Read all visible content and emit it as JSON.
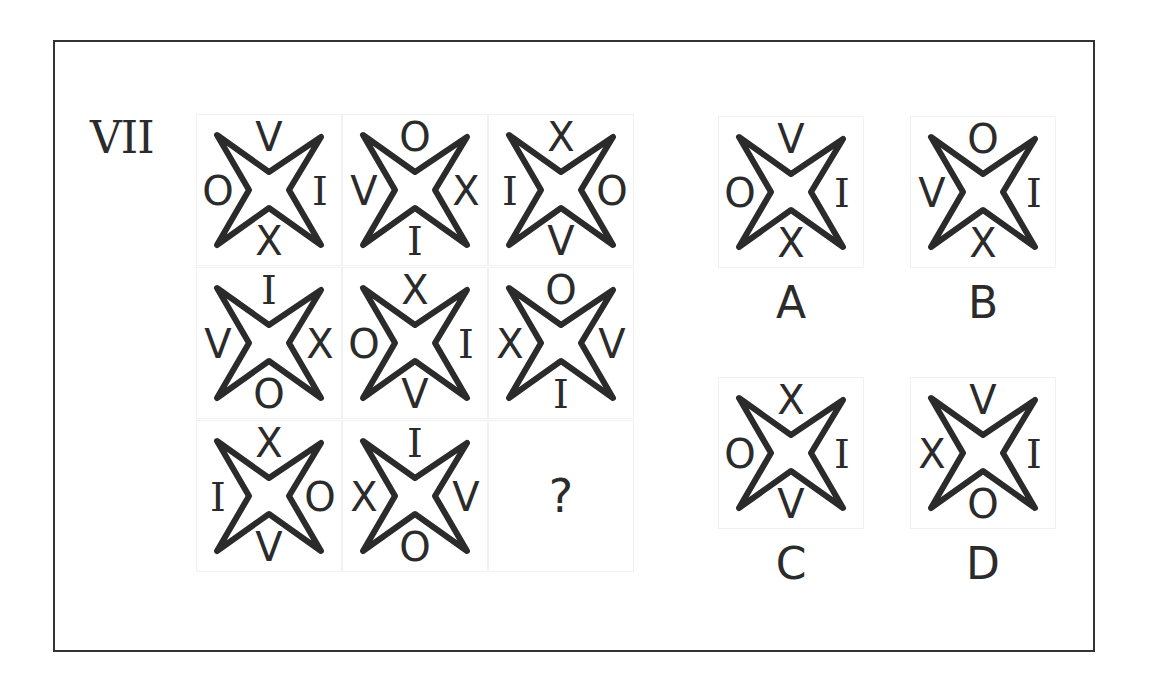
{
  "puzzle": {
    "number": "VII",
    "matrix": [
      {
        "top": "V",
        "left": "O",
        "right": "I",
        "bottom": "X"
      },
      {
        "top": "O",
        "left": "V",
        "right": "X",
        "bottom": "I"
      },
      {
        "top": "X",
        "left": "I",
        "right": "O",
        "bottom": "V"
      },
      {
        "top": "I",
        "left": "V",
        "right": "X",
        "bottom": "O"
      },
      {
        "top": "X",
        "left": "O",
        "right": "I",
        "bottom": "V"
      },
      {
        "top": "O",
        "left": "X",
        "right": "V",
        "bottom": "I"
      },
      {
        "top": "X",
        "left": "I",
        "right": "O",
        "bottom": "V"
      },
      {
        "top": "I",
        "left": "X",
        "right": "V",
        "bottom": "O"
      }
    ],
    "missing_symbol": "?",
    "options": [
      {
        "label": "A",
        "top": "V",
        "left": "O",
        "right": "I",
        "bottom": "X"
      },
      {
        "label": "B",
        "top": "O",
        "left": "V",
        "right": "I",
        "bottom": "X"
      },
      {
        "label": "C",
        "top": "X",
        "left": "O",
        "right": "I",
        "bottom": "V"
      },
      {
        "label": "D",
        "top": "V",
        "left": "X",
        "right": "I",
        "bottom": "O"
      }
    ]
  },
  "colors": {
    "stroke": "#2b2b2b",
    "frame": "#333333",
    "background": "#ffffff"
  }
}
